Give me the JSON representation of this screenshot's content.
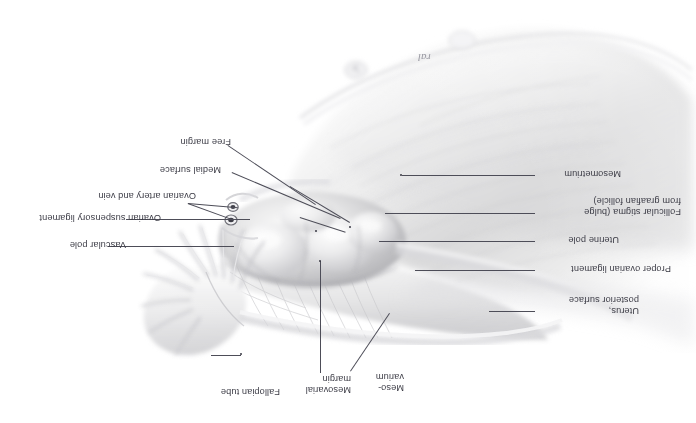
{
  "figure": {
    "background_color": "#ffffff",
    "text_color": "#3c3c46",
    "leader_color": "#4d4d58",
    "orientation": "rotated-180",
    "width": 696,
    "height": 423
  },
  "signature": {
    "mark": "ral"
  },
  "labels": [
    {
      "id": "free-margin",
      "text": "Free margin",
      "side": "left"
    },
    {
      "id": "medial-surface",
      "text": "Medial surface",
      "side": "left"
    },
    {
      "id": "ovarian-artery-vein",
      "text": "Ovarian artery and vein",
      "side": "left"
    },
    {
      "id": "ovarian-susp-ligament",
      "text": "Ovarian suspensory ligament",
      "side": "left"
    },
    {
      "id": "vascular-pole",
      "text": "Vascular pole",
      "side": "left"
    },
    {
      "id": "mesometrium",
      "text": "Mesometrium",
      "side": "right"
    },
    {
      "id": "follicular-stigma",
      "text": "Follicular stigma (bulge\nfrom graafian follicle)",
      "side": "right"
    },
    {
      "id": "uterine-pole",
      "text": "Uterine pole",
      "side": "right"
    },
    {
      "id": "proper-ovarian-ligament",
      "text": "Proper ovarian ligament",
      "side": "right"
    },
    {
      "id": "uterus-posterior",
      "text": "Uterus,\nposterior surface",
      "side": "right"
    },
    {
      "id": "fallopian-tube",
      "text": "Fallopian tube",
      "side": "bottom"
    },
    {
      "id": "mesovarial-margin",
      "text": "Mesovarial\nmargin",
      "side": "bottom"
    },
    {
      "id": "mesovarium",
      "text": "Meso-\nvarium",
      "side": "bottom"
    }
  ]
}
